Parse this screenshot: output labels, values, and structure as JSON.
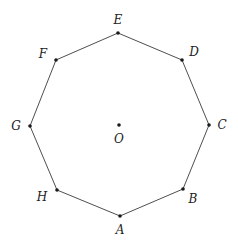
{
  "diagram": {
    "type": "regular-octagon",
    "center": {
      "name": "O",
      "x": 119,
      "y": 125,
      "label_x": 119,
      "label_y": 143
    },
    "vertices": [
      {
        "name": "A",
        "x": 120,
        "y": 216,
        "label_x": 120,
        "label_y": 234
      },
      {
        "name": "B",
        "x": 183,
        "y": 189,
        "label_x": 193,
        "label_y": 203
      },
      {
        "name": "C",
        "x": 209,
        "y": 125,
        "label_x": 222,
        "label_y": 129
      },
      {
        "name": "D",
        "x": 182,
        "y": 60,
        "label_x": 194,
        "label_y": 56
      },
      {
        "name": "E",
        "x": 118,
        "y": 33,
        "label_x": 118,
        "label_y": 24
      },
      {
        "name": "F",
        "x": 56,
        "y": 60,
        "label_x": 43,
        "label_y": 58
      },
      {
        "name": "G",
        "x": 30,
        "y": 126,
        "label_x": 16,
        "label_y": 130
      },
      {
        "name": "H",
        "x": 57,
        "y": 190,
        "label_x": 42,
        "label_y": 201
      }
    ],
    "colors": {
      "edge": "#3a3a3a",
      "dot": "#1a1a1a",
      "label": "#222222",
      "background": "#ffffff"
    }
  }
}
